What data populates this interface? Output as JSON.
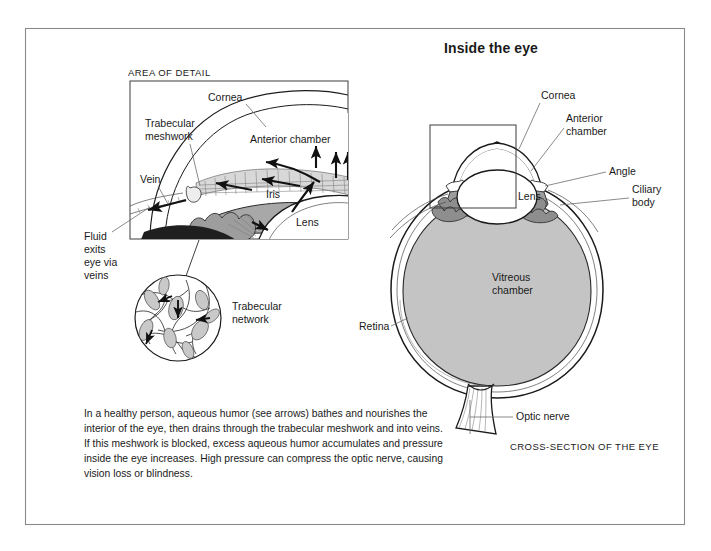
{
  "figure": {
    "title": "Inside the eye",
    "detail_panel_caption": "AREA OF DETAIL",
    "cross_section_caption": "CROSS-SECTION OF THE EYE"
  },
  "colors": {
    "frame_border": "#8a8a8a",
    "outline": "#1a1a1a",
    "vitreous_fill": "#c4c4c4",
    "iris_fill": "#a8a8a8",
    "ciliary_fill": "#9a9a9a",
    "mesh_fill": "#d2d2d2",
    "leader_line": "#6d6d6d",
    "text": "#1a1a1a",
    "background": "#ffffff"
  },
  "detail_panel": {
    "caption": "AREA OF DETAIL",
    "labels": [
      {
        "id": "cornea",
        "text": "Cornea"
      },
      {
        "id": "trabecular-meshwork-line1",
        "text": "Trabecular"
      },
      {
        "id": "trabecular-meshwork-line2",
        "text": "meshwork"
      },
      {
        "id": "anterior-chamber",
        "text": "Anterior chamber"
      },
      {
        "id": "vein",
        "text": "Vein"
      },
      {
        "id": "iris",
        "text": "Iris"
      },
      {
        "id": "lens",
        "text": "Lens"
      }
    ],
    "fluid_exit_note": {
      "line1": "Fluid",
      "line2": "exits",
      "line3": "eye via",
      "line4": "veins"
    }
  },
  "trabecular_inset": {
    "label_line1": "Trabecular",
    "label_line2": "network"
  },
  "cross_section": {
    "caption": "CROSS-SECTION OF THE EYE",
    "labels": [
      {
        "id": "cornea",
        "text": "Cornea"
      },
      {
        "id": "anterior-chamber-line1",
        "text": "Anterior"
      },
      {
        "id": "anterior-chamber-line2",
        "text": "chamber"
      },
      {
        "id": "angle",
        "text": "Angle"
      },
      {
        "id": "ciliary-body-line1",
        "text": "Ciliary"
      },
      {
        "id": "ciliary-body-line2",
        "text": "body"
      },
      {
        "id": "lens",
        "text": "Lens"
      },
      {
        "id": "vitreous-chamber-line1",
        "text": "Vitreous"
      },
      {
        "id": "vitreous-chamber-line2",
        "text": "chamber"
      },
      {
        "id": "retina",
        "text": "Retina"
      },
      {
        "id": "optic-nerve",
        "text": "Optic nerve"
      }
    ]
  },
  "caption": {
    "line1": "In a healthy person, aqueous humor (see arrows) bathes and nourishes the",
    "line2": "interior of the eye, then drains through the trabecular meshwork and into veins.",
    "line3": "If this meshwork is blocked, excess aqueous humor accumulates and pressure",
    "line4": "inside the eye increases. High pressure can compress the optic nerve, causing",
    "line5": "vision loss or blindness."
  }
}
